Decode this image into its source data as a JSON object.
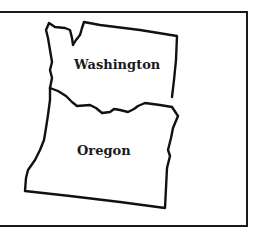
{
  "map": {
    "regions": [
      {
        "name": "Washington",
        "label": "Washington"
      },
      {
        "name": "Oregon",
        "label": "Oregon"
      }
    ],
    "colors": {
      "stroke": "#111111",
      "background": "#ffffff"
    }
  }
}
